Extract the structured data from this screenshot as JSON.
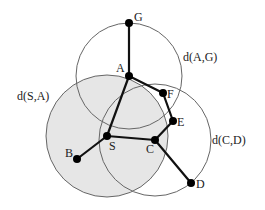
{
  "diagram": {
    "type": "graph-with-distance-circles",
    "colors": {
      "edge": "#111111",
      "node": "#000000",
      "circle_stroke": "#666666",
      "shaded_fill": "#e6e6e6",
      "background": "#ffffff"
    },
    "nodes": [
      {
        "id": "G",
        "label": "G",
        "x": 129,
        "y": 23,
        "lx": 134,
        "ly": 21
      },
      {
        "id": "A",
        "label": "A",
        "x": 129,
        "y": 76,
        "lx": 116,
        "ly": 72
      },
      {
        "id": "F",
        "label": "F",
        "x": 163,
        "y": 93,
        "lx": 167,
        "ly": 98
      },
      {
        "id": "E",
        "label": "E",
        "x": 173,
        "y": 121,
        "lx": 177,
        "ly": 126
      },
      {
        "id": "C",
        "label": "C",
        "x": 155,
        "y": 140,
        "lx": 146,
        "ly": 153
      },
      {
        "id": "S",
        "label": "S",
        "x": 107,
        "y": 136,
        "lx": 109,
        "ly": 150
      },
      {
        "id": "B",
        "label": "B",
        "x": 77,
        "y": 159,
        "lx": 65,
        "ly": 157
      },
      {
        "id": "D",
        "label": "D",
        "x": 191,
        "y": 183,
        "lx": 196,
        "ly": 188
      }
    ],
    "edges": [
      {
        "from": "G",
        "to": "A"
      },
      {
        "from": "A",
        "to": "F"
      },
      {
        "from": "F",
        "to": "E"
      },
      {
        "from": "E",
        "to": "C"
      },
      {
        "from": "A",
        "to": "S"
      },
      {
        "from": "S",
        "to": "C"
      },
      {
        "from": "S",
        "to": "B"
      },
      {
        "from": "C",
        "to": "D"
      }
    ],
    "circles": [
      {
        "name": "d(S,A)",
        "center": "S",
        "cx": 107,
        "cy": 136,
        "r": 61,
        "shaded": true,
        "label": "d(S,A)",
        "lx": 17,
        "ly": 100
      },
      {
        "name": "d(A,G)",
        "center": "A",
        "cx": 129,
        "cy": 76,
        "r": 53,
        "shaded": false,
        "label": "d(A,G)",
        "lx": 183,
        "ly": 61
      },
      {
        "name": "d(C,D)",
        "center": "C",
        "cx": 155,
        "cy": 140,
        "r": 56,
        "shaded": false,
        "label": "d(C,D)",
        "lx": 212,
        "ly": 144
      }
    ]
  }
}
